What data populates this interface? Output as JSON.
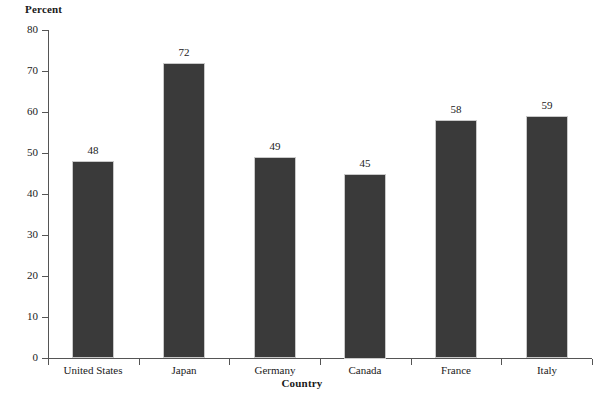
{
  "chart_data": {
    "type": "bar",
    "title": "",
    "xlabel": "Country",
    "ylabel": "Percent",
    "categories": [
      "United States",
      "Japan",
      "Germany",
      "Canada",
      "France",
      "Italy"
    ],
    "values": [
      48,
      72,
      49,
      45,
      58,
      59
    ],
    "value_labels": [
      "48",
      "72",
      "49",
      "45",
      "58",
      "59"
    ],
    "ylim": [
      0,
      80
    ],
    "yticks": [
      0,
      10,
      20,
      30,
      40,
      50,
      60,
      70,
      80
    ],
    "ytick_labels": [
      "0",
      "10",
      "20",
      "30",
      "40",
      "50",
      "60",
      "70",
      "80"
    ],
    "grid": false,
    "legend": null,
    "bar_color": "#3a3a3a",
    "axis_color": "#555555",
    "background_color": "#ffffff"
  }
}
